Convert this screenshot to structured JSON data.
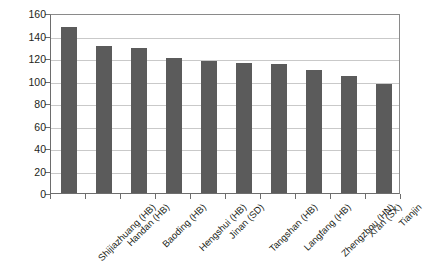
{
  "chart_data": {
    "type": "bar",
    "title": "",
    "subtitle": "",
    "xlabel": "",
    "ylabel": "",
    "categories": [
      "Shijiazhuang (HB)",
      "Handan (HB)",
      "Baoding (HB)",
      "Hengshui (HB)",
      "Jinan (SD)",
      "Tangshan (HB)",
      "Langfang (HB)",
      "Zhengzhou (HN)",
      "Xi'an (SX)",
      "Tianjin"
    ],
    "values": [
      148,
      131,
      129,
      120,
      117,
      116,
      115,
      109,
      104,
      97
    ],
    "ylim": [
      0,
      160
    ],
    "y_ticks": [
      0,
      20,
      40,
      60,
      80,
      100,
      120,
      140,
      160
    ],
    "y_tick_labels": [
      "0",
      "20",
      "40",
      "60",
      "80",
      "100",
      "120",
      "140",
      "160"
    ],
    "grid": "horizontal",
    "legend": "none",
    "series": [
      {
        "name": "",
        "values": [
          148,
          131,
          129,
          120,
          117,
          116,
          115,
          109,
          104,
          97
        ],
        "color": "#5b5b5b"
      }
    ],
    "colors": {
      "bar": "#5b5b5b",
      "grid": "#c9c9c9",
      "axis": "#6d6d6d",
      "text": "#231f20",
      "background": "#ffffff"
    }
  }
}
